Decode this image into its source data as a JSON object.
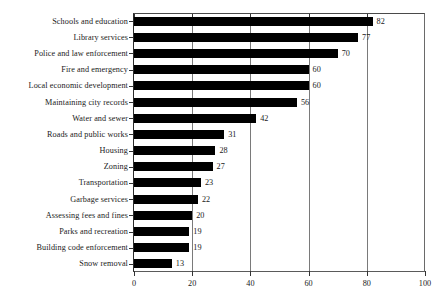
{
  "chart_data": {
    "type": "bar",
    "orientation": "horizontal",
    "title": "",
    "subtitle": "",
    "xlabel": "",
    "ylabel": "",
    "xlim": [
      0,
      100
    ],
    "xticks": [
      0,
      20,
      40,
      60,
      80,
      100
    ],
    "grid": true,
    "grid_axis": "x",
    "legend": "none",
    "show_value_labels": true,
    "bar_color": "#000000",
    "categories": [
      "Schools and education",
      "Library services",
      "Police and law enforcement",
      "Fire and emergency",
      "Local economic development",
      "Maintaining city records",
      "Water and sewer",
      "Roads and public works",
      "Housing",
      "Zoning",
      "Transportation",
      "Garbage services",
      "Assessing fees and fines",
      "Parks and recreation",
      "Building code enforcement",
      "Snow removal"
    ],
    "values": [
      82,
      77,
      70,
      60,
      60,
      56,
      42,
      31,
      28,
      27,
      23,
      22,
      20,
      19,
      19,
      13
    ],
    "value_labels": [
      "82",
      "77",
      "70",
      "60",
      "60",
      "56",
      "42",
      "31",
      "28",
      "27",
      "23",
      "22",
      "20",
      "19",
      "19",
      "13"
    ],
    "tick_labels": [
      "0",
      "20",
      "40",
      "60",
      "80",
      "100"
    ]
  }
}
